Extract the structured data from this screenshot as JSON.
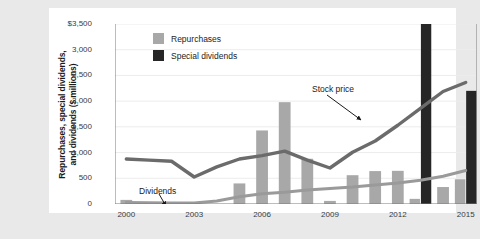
{
  "chart_data": {
    "type": "bar",
    "title": "",
    "xlabel": "",
    "ylabel": "Repurchases, special dividends, and dividends ($ millions)",
    "ylabel_right": "Stock price",
    "ylabel_line1": "Repurchases, special dividends,",
    "ylabel_line2": "and dividends ($ millions)",
    "grid": true,
    "legend_position": "top-left",
    "ylim": [
      0,
      3500
    ],
    "ylim_right": [
      0,
      160
    ],
    "yticks": [
      "$3,500",
      "3,000",
      "2,500",
      "2,000",
      "1,500",
      "1,000",
      "500",
      "0"
    ],
    "ytick_values": [
      3500,
      3000,
      2500,
      2000,
      1500,
      1000,
      500,
      0
    ],
    "yticks_right": [
      "$160",
      "140",
      "120",
      "100",
      "80",
      "40",
      "20",
      "0"
    ],
    "ytick_right_values": [
      160,
      140,
      120,
      100,
      80,
      40,
      20,
      0
    ],
    "x": [
      2000,
      2001,
      2002,
      2003,
      2004,
      2005,
      2006,
      2007,
      2008,
      2009,
      2010,
      2011,
      2012,
      2013,
      2014,
      2015
    ],
    "categories": [
      "2000",
      "2001",
      "2002",
      "2003",
      "2004",
      "2005",
      "2006",
      "2007",
      "2008",
      "2009",
      "2010",
      "2011",
      "2012",
      "2013",
      "2014",
      "2015"
    ],
    "xticks": [
      "2000",
      "2003",
      "2006",
      "2009",
      "2012",
      "2015"
    ],
    "xtick_values": [
      2000,
      2003,
      2006,
      2009,
      2012,
      2015
    ],
    "series": [
      {
        "name": "Repurchases",
        "type": "bar",
        "axis": "left",
        "color": "#a8a8a8",
        "values": [
          80,
          0,
          0,
          0,
          0,
          400,
          1430,
          1980,
          880,
          60,
          560,
          640,
          645,
          100,
          330,
          480
        ]
      },
      {
        "name": "Special dividends",
        "type": "bar",
        "axis": "left",
        "color": "#262626",
        "values": [
          0,
          0,
          0,
          0,
          0,
          0,
          0,
          0,
          0,
          0,
          0,
          0,
          0,
          3520,
          0,
          2200
        ]
      },
      {
        "name": "Stock price",
        "type": "line",
        "axis": "right",
        "color": "#6b6b6b",
        "values": [
          40,
          39,
          38,
          24,
          33,
          40,
          43,
          47,
          39,
          32,
          46,
          56,
          70,
          85,
          100,
          108
        ]
      },
      {
        "name": "Dividends",
        "type": "line",
        "axis": "left",
        "color": "#9a9a9a",
        "values": [
          30,
          22,
          18,
          20,
          60,
          140,
          200,
          230,
          270,
          300,
          330,
          370,
          410,
          460,
          540,
          650
        ]
      }
    ],
    "annotations": [
      {
        "name": "stock-price",
        "text": "Stock price"
      },
      {
        "name": "dividends",
        "text": "Dividends"
      }
    ],
    "legend": [
      {
        "label": "Repurchases",
        "color": "#a8a8a8"
      },
      {
        "label": "Special dividends",
        "color": "#262626"
      }
    ],
    "colors": {
      "repurchases": "#a8a8a8",
      "special_dividends": "#262626",
      "stock_price_line": "#6b6b6b",
      "dividends_line": "#9a9a9a",
      "plot_background": "#ffffff",
      "page_background": "#e9e9e9",
      "axis": "#7a7a7a",
      "grid": "#ececec"
    }
  }
}
